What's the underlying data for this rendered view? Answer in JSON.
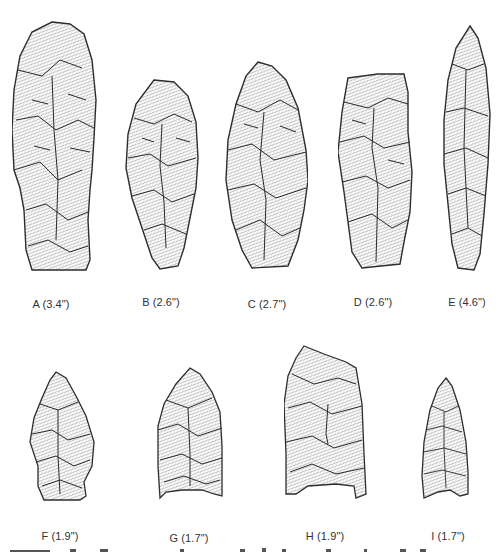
{
  "figure": {
    "colors": {
      "outline": "#2a2a2a",
      "fill": "#e9e9e9",
      "hatch": "#6f6f6f",
      "label": "#333333"
    },
    "rows": [
      {
        "points": [
          {
            "id": "A",
            "label": "A (3.4\")",
            "length_in": 3.4
          },
          {
            "id": "B",
            "label": "B (2.6\")",
            "length_in": 2.6
          },
          {
            "id": "C",
            "label": "C (2.7\")",
            "length_in": 2.7
          },
          {
            "id": "D",
            "label": "D (2.6\")",
            "length_in": 2.6
          },
          {
            "id": "E",
            "label": "E (4.6\")",
            "length_in": 4.6
          }
        ]
      },
      {
        "points": [
          {
            "id": "F",
            "label": "F (1.9\")",
            "length_in": 1.9
          },
          {
            "id": "G",
            "label": "G (1.7\")",
            "length_in": 1.7
          },
          {
            "id": "H",
            "label": "H (1.9\")",
            "length_in": 1.9
          },
          {
            "id": "I",
            "label": "I (1.7\")",
            "length_in": 1.7
          }
        ]
      }
    ]
  }
}
